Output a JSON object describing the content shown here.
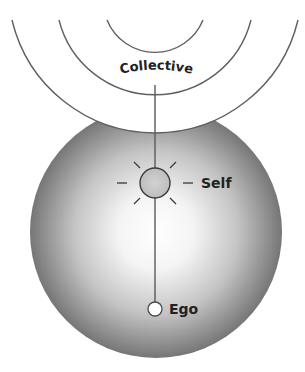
{
  "diagram": {
    "labels": {
      "collective": "Collective",
      "self": "Self",
      "ego": "Ego"
    },
    "colors": {
      "background": "#ffffff",
      "line": "#5a5a5a",
      "sphere_light": "#ffffff",
      "sphere_dark": "#6e6e6e",
      "self_fill": "#c8c8c8",
      "ego_fill": "#ffffff",
      "text": "#222222"
    },
    "elements": [
      {
        "id": "collective-rings",
        "type": "concentric-arcs",
        "count": 3
      },
      {
        "id": "psyche-sphere",
        "type": "shaded-sphere"
      },
      {
        "id": "self-node",
        "type": "circle-with-rays",
        "rays": 8
      },
      {
        "id": "ego-node",
        "type": "circle"
      },
      {
        "id": "axis-line",
        "type": "line",
        "connects": [
          "collective",
          "self",
          "ego"
        ]
      }
    ]
  }
}
